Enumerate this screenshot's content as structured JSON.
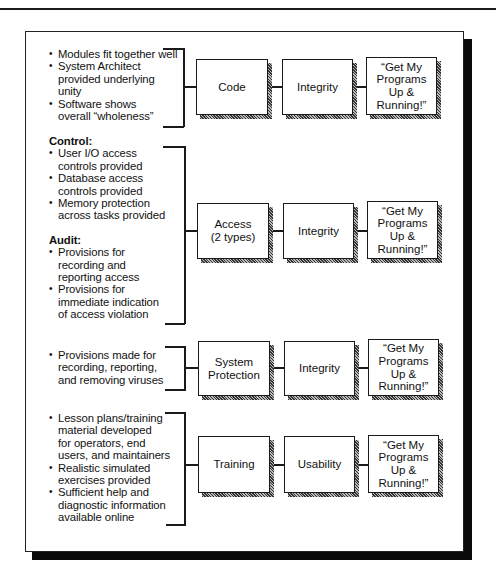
{
  "diagram": {
    "rows": [
      {
        "sections": [
          {
            "heading": null,
            "bullets": [
              "Modules fit together well",
              "System Architect provided underlying unity",
              "Software shows overall “wholeness”"
            ]
          }
        ],
        "boxes": [
          "Code",
          "Integrity",
          "“Get My Programs Up & Running!”"
        ]
      },
      {
        "sections": [
          {
            "heading": "Control:",
            "bullets": [
              "User I/O access controls provided",
              "Database access controls provided",
              "Memory protection across tasks provided"
            ]
          },
          {
            "heading": "Audit:",
            "bullets": [
              "Provisions for recording and reporting access",
              "Provisions for immediate indication of access violation"
            ]
          }
        ],
        "boxes": [
          "Access (2 types)",
          "Integrity",
          "“Get My Programs Up & Running!”"
        ]
      },
      {
        "sections": [
          {
            "heading": null,
            "bullets": [
              "Provisions made for recording, reporting, and removing viruses"
            ]
          }
        ],
        "boxes": [
          "System Protection",
          "Integrity",
          "“Get My Programs Up & Running!”"
        ]
      },
      {
        "sections": [
          {
            "heading": null,
            "bullets": [
              "Lesson plans/training material developed for operators, end users, and maintainers",
              "Realistic simulated exercises provided",
              "Sufficient help and diagnostic information available online"
            ]
          }
        ],
        "boxes": [
          "Training",
          "Usability",
          "“Get My Programs Up & Running!”"
        ]
      }
    ]
  },
  "lines": {
    "r0": [
      "Modules fit together well",
      "System Architect",
      "provided underlying",
      "unity",
      "Software shows",
      "overall “wholeness”"
    ],
    "r1c": [
      "User I/O access",
      "controls provided",
      "Database access",
      "controls provided",
      "Memory protection",
      "across tasks provided"
    ],
    "r1a": [
      "Provisions for",
      "recording and",
      "reporting access",
      "Provisions for",
      "immediate indication",
      "of access violation"
    ],
    "r2": [
      "Provisions made for",
      "recording, reporting,",
      "and removing viruses"
    ],
    "r3": [
      "Lesson plans/training",
      "material developed",
      "for operators, end",
      "users, and maintainers",
      "Realistic simulated",
      "exercises provided",
      "Sufficient help and",
      "diagnostic information",
      "available online"
    ],
    "h_control": "Control:",
    "h_audit": "Audit:",
    "b0": [
      "Code",
      "Integrity",
      "“Get My",
      "Programs",
      "Up &",
      "Running!”"
    ],
    "b1": [
      "Access",
      "(2 types)",
      "Integrity"
    ],
    "b2": [
      "System",
      "Protection",
      "Integrity"
    ],
    "b3": [
      "Training",
      "Usability"
    ]
  }
}
